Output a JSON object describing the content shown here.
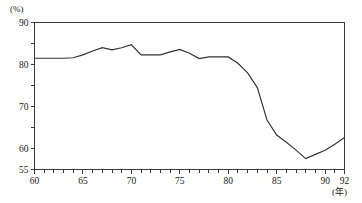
{
  "chart_data": {
    "type": "line",
    "title": "",
    "xlabel": "(年)",
    "ylabel": "(%)",
    "xlim": [
      60,
      92
    ],
    "ylim": [
      55,
      90
    ],
    "grid": false,
    "legend": null,
    "x_ticks_major": [
      60,
      65,
      70,
      75,
      80,
      85,
      90,
      92
    ],
    "x_tick_labels": [
      "60",
      "65",
      "70",
      "75",
      "80",
      "85",
      "90",
      "92"
    ],
    "x_ticks_minor_step": 1,
    "y_ticks_major": [
      55,
      60,
      70,
      80,
      90
    ],
    "y_tick_labels": [
      "55",
      "60",
      "70",
      "80",
      "90"
    ],
    "y_ticks_minor": [
      65,
      75,
      85
    ],
    "series": [
      {
        "name": "series-1",
        "x": [
          60,
          61,
          62,
          63,
          64,
          65,
          66,
          67,
          68,
          69,
          70,
          71,
          72,
          73,
          74,
          75,
          76,
          77,
          78,
          79,
          80,
          81,
          82,
          83,
          84,
          85,
          86,
          87,
          88,
          89,
          90,
          91,
          92
        ],
        "values": [
          81.5,
          81.5,
          81.5,
          81.5,
          81.6,
          82.3,
          83.2,
          84.0,
          83.5,
          84.0,
          84.7,
          82.3,
          82.3,
          82.3,
          83.0,
          83.6,
          82.7,
          81.4,
          81.8,
          81.8,
          81.8,
          80.3,
          78.0,
          74.5,
          66.8,
          63.2,
          61.5,
          59.6,
          57.6,
          58.6,
          59.6,
          61.0,
          62.6
        ]
      }
    ]
  },
  "labels": {
    "y_axis_unit": "(%)",
    "x_axis_unit": "(年)"
  }
}
